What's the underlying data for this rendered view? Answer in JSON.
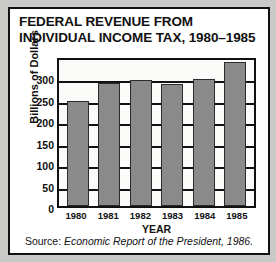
{
  "chart_data": {
    "type": "bar",
    "title_line1": "FEDERAL REVENUE FROM",
    "title_line2": "INDIVIDUAL INCOME TAX, 1980–1985",
    "categories": [
      "1980",
      "1981",
      "1982",
      "1983",
      "1984",
      "1985"
    ],
    "values": [
      244,
      287,
      293,
      285,
      297,
      335
    ],
    "xlabel": "YEAR",
    "ylabel": "Billions of Dollars",
    "ylim": [
      0,
      350
    ],
    "yticks": [
      0,
      50,
      100,
      150,
      200,
      250,
      300
    ],
    "ytick_labels": [
      "0",
      "50",
      "100",
      "150",
      "200",
      "250",
      "300"
    ],
    "grid": true,
    "legend": "none",
    "bar_color": "#8a8a8a",
    "bar_border_color": "#2b2b2b",
    "axis_color": "#111111",
    "plot_background": "#fbfbf9"
  },
  "source": {
    "prefix": "Source:",
    "publication": "Economic Report of the President,",
    "year": "1986."
  }
}
